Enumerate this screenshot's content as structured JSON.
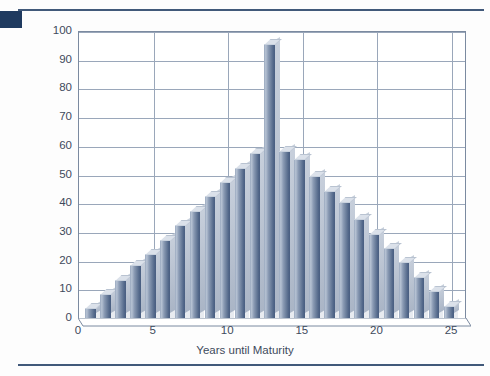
{
  "page": {
    "background_color": "#fdfdfd",
    "accent_color": "#1f3a5f",
    "rule_color": "#41597a"
  },
  "chart_data": {
    "type": "bar",
    "title": "",
    "subtitle": "",
    "xlabel": "Years until Maturity",
    "ylabel": "Par Value Held ($ in Thousands)",
    "xlim": [
      0,
      26
    ],
    "ylim": [
      0,
      100
    ],
    "ytick_step": 10,
    "grid": true,
    "legend": "none",
    "style": "3d-column",
    "series_color": "#6e819e",
    "categories": [
      1,
      2,
      3,
      4,
      5,
      6,
      7,
      8,
      9,
      10,
      11,
      12,
      13,
      14,
      15,
      16,
      17,
      18,
      19,
      20,
      21,
      22,
      23,
      24,
      25
    ],
    "xtick_labels": [
      "0",
      "5",
      "10",
      "15",
      "20",
      "25"
    ],
    "xtick_values": [
      0,
      5,
      10,
      15,
      20,
      25
    ],
    "ytick_labels": [
      "0",
      "10",
      "20",
      "30",
      "40",
      "50",
      "60",
      "70",
      "80",
      "90",
      "100"
    ],
    "ytick_values": [
      0,
      10,
      20,
      30,
      40,
      50,
      60,
      70,
      80,
      90,
      100
    ],
    "values": [
      3,
      8,
      13,
      18,
      22,
      27,
      32,
      37,
      42,
      47,
      52,
      57,
      95,
      58,
      55,
      49,
      44,
      40,
      34,
      29,
      24,
      19,
      14,
      9,
      4
    ],
    "annotations": []
  },
  "axes": {
    "y_title": "Par Value Held ($ in Thousands)",
    "x_title": "Years until Maturity"
  }
}
